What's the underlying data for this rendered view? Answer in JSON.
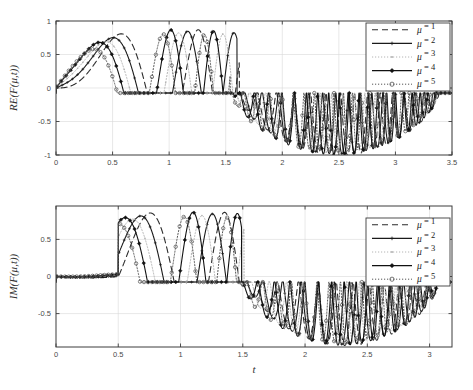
{
  "figure": {
    "background": "#ffffff",
    "foreground": "#1a1a1a"
  },
  "chart_data": [
    {
      "id": "real-part",
      "type": "line",
      "title": "",
      "xlabel": "",
      "ylabel": "RE(F(μ,t))",
      "xlim": [
        0,
        3.5
      ],
      "ylim": [
        -1,
        1
      ],
      "xticks": [
        0,
        0.5,
        1,
        1.5,
        2,
        2.5,
        3,
        3.5
      ],
      "xticklabels": [
        "0",
        "0.5",
        "1",
        "1.5",
        "2",
        "2.5",
        "3",
        "3.5"
      ],
      "yticks": [
        -1,
        -0.5,
        0,
        0.5,
        1
      ],
      "yticklabels": [
        "-1",
        "-0.5",
        "0",
        "0.5",
        "1"
      ],
      "grid": true,
      "legend_position": "upper right",
      "series": [
        {
          "name": "μ = 1",
          "mu": 1,
          "style": "dashed",
          "color": "#2b2b2b",
          "marker": "none",
          "envelope_scale": 1.0,
          "freq": 5.4,
          "phase": 0.0,
          "decay_start": 1.62
        },
        {
          "name": "μ = 2",
          "mu": 2,
          "style": "solid",
          "color": "#1a1a1a",
          "marker": "plus",
          "envelope_scale": 0.97,
          "freq": 6.1,
          "phase": 0.25,
          "decay_start": 1.6
        },
        {
          "name": "μ = 3",
          "mu": 3,
          "style": "dotted",
          "color": "#b4b4b4",
          "marker": "dot",
          "envelope_scale": 0.94,
          "freq": 6.8,
          "phase": 0.5,
          "decay_start": 1.58
        },
        {
          "name": "μ = 4",
          "mu": 4,
          "style": "solid",
          "color": "#111111",
          "marker": "diamond",
          "envelope_scale": 0.99,
          "freq": 7.5,
          "phase": 0.75,
          "decay_start": 1.56
        },
        {
          "name": "μ = 5",
          "mu": 5,
          "style": "dotted",
          "color": "#555555",
          "marker": "circle",
          "envelope_scale": 0.92,
          "freq": 8.3,
          "phase": 1.0,
          "decay_start": 1.54
        }
      ],
      "annotations": [
        {
          "text": "rectified oscillatory packet, positive lobes decay to clipped baseline near y = -0.08 after t ≈ 1.7"
        },
        {
          "text": "negative dense oscillation band between t ≈ 1.85 and t ≈ 3.05 reaching y ≈ -1"
        }
      ]
    },
    {
      "id": "imag-part",
      "type": "line",
      "title": "",
      "xlabel": "t",
      "ylabel": "IM(F(μ,t))",
      "xlim": [
        0,
        3.18
      ],
      "ylim": [
        -0.95,
        0.95
      ],
      "xticks": [
        0,
        0.5,
        1,
        1.5,
        2,
        2.5,
        3
      ],
      "xticklabels": [
        "0",
        "0.5",
        "1",
        "1.5",
        "2",
        "2.5",
        "3"
      ],
      "yticks": [
        -0.5,
        0,
        0.5
      ],
      "yticklabels": [
        "-0.5",
        "0",
        "0.5"
      ],
      "grid": true,
      "legend_position": "upper right",
      "series": [
        {
          "name": "μ = 1",
          "mu": 1,
          "style": "dashed",
          "color": "#2b2b2b",
          "marker": "none",
          "envelope_scale": 1.0,
          "freq": 5.4,
          "phase": 0.0,
          "decay_start": 1.55
        },
        {
          "name": "μ = 2",
          "mu": 2,
          "style": "solid",
          "color": "#1a1a1a",
          "marker": "plus",
          "envelope_scale": 0.97,
          "freq": 6.1,
          "phase": 0.25,
          "decay_start": 1.53
        },
        {
          "name": "μ = 3",
          "mu": 3,
          "style": "dotted",
          "color": "#b4b4b4",
          "marker": "dot",
          "envelope_scale": 0.94,
          "freq": 6.8,
          "phase": 0.5,
          "decay_start": 1.51
        },
        {
          "name": "μ = 4",
          "mu": 4,
          "style": "solid",
          "color": "#111111",
          "marker": "diamond",
          "envelope_scale": 0.99,
          "freq": 7.5,
          "phase": 0.75,
          "decay_start": 1.49
        },
        {
          "name": "μ = 5",
          "mu": 5,
          "style": "dotted",
          "color": "#555555",
          "marker": "circle",
          "envelope_scale": 0.92,
          "freq": 8.3,
          "phase": 1.0,
          "decay_start": 1.47
        }
      ],
      "annotations": [
        {
          "text": "flat clipped baseline from t = 0 to t ≈ 0.55 then positive lobes up to y ≈ 0.9"
        },
        {
          "text": "negative dense oscillation band from t ≈ 1.9 to t ≈ 3.1 reaching y ≈ -0.9"
        }
      ]
    }
  ],
  "legend": {
    "entries": [
      {
        "label_mu": "μ",
        "label_eq": "= 1"
      },
      {
        "label_mu": "μ",
        "label_eq": "= 2"
      },
      {
        "label_mu": "μ",
        "label_eq": "= 3"
      },
      {
        "label_mu": "μ",
        "label_eq": "= 4"
      },
      {
        "label_mu": "μ",
        "label_eq": "= 5"
      }
    ]
  },
  "labels": {
    "y_top": "RE(F(μ,t))",
    "y_bottom": "IM(F(μ,t))",
    "x_bottom": "t"
  }
}
